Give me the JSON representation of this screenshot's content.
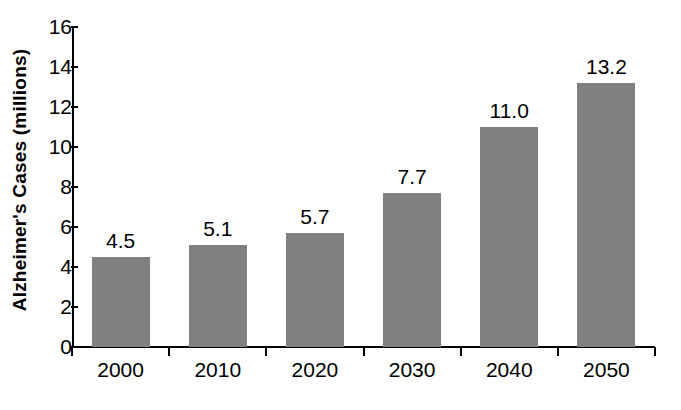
{
  "chart_data": {
    "type": "bar",
    "title": "",
    "xlabel": "",
    "ylabel": "Alzheimer's Cases (millions)",
    "categories": [
      "2000",
      "2010",
      "2020",
      "2030",
      "2040",
      "2050"
    ],
    "values": [
      4.5,
      5.1,
      5.7,
      7.7,
      11.0,
      13.2
    ],
    "value_labels": [
      "4.5",
      "5.1",
      "5.7",
      "7.7",
      "11.0",
      "13.2"
    ],
    "ylim": [
      0,
      16
    ],
    "ytick_values": [
      0,
      2,
      4,
      6,
      8,
      10,
      12,
      14,
      16
    ],
    "ytick_labels": [
      "0",
      "2",
      "4",
      "6",
      "8",
      "10",
      "12",
      "14",
      "16"
    ],
    "grid": false,
    "legend": null,
    "bar_color": "#808080",
    "axis_color": "#000000",
    "background_color": "#ffffff"
  }
}
